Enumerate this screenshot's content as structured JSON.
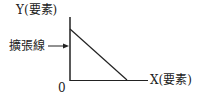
{
  "diagram": {
    "y_axis_label": "Y(要素)",
    "x_axis_label": "X(要素)",
    "origin_label": "0",
    "line_label": "擴張線",
    "colors": {
      "line": "#222222",
      "text": "#222222",
      "background": "#ffffff"
    }
  }
}
